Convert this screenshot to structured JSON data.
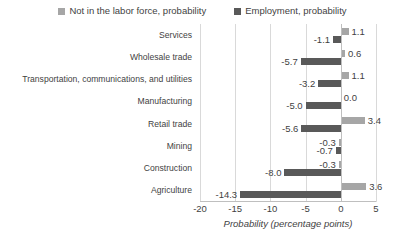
{
  "chart_data": {
    "type": "bar",
    "orientation": "horizontal",
    "title": "",
    "xlabel": "Probability (percentage points)",
    "ylabel": "",
    "xlim": [
      -20,
      5
    ],
    "xticks": [
      -20,
      -15,
      -10,
      -5,
      0,
      5
    ],
    "xtick_labels": [
      "-20",
      "-15",
      "-10",
      "-5",
      "0",
      "5"
    ],
    "grid": true,
    "grid_axis": "x",
    "legend_position": "top",
    "categories": [
      "Services",
      "Wholesale trade",
      "Transportation, communications, and utilities",
      "Manufacturing",
      "Retail trade",
      "Mining",
      "Construction",
      "Agriculture"
    ],
    "series": [
      {
        "name": "Not in the labor force, probability",
        "color": "#a6a6a6",
        "values": [
          1.1,
          0.6,
          1.1,
          0.0,
          3.4,
          -0.3,
          -0.3,
          3.6
        ],
        "labels": [
          "1.1",
          "0.6",
          "1.1",
          "0.0",
          "3.4",
          "-0.3",
          "-0.3",
          "3.6"
        ]
      },
      {
        "name": "Employment, probability",
        "color": "#595959",
        "values": [
          -1.1,
          -5.7,
          -3.2,
          -5.0,
          -5.6,
          -0.7,
          -8.0,
          -14.3
        ],
        "labels": [
          "-1.1",
          "-5.7",
          "-3.2",
          "-5.0",
          "-5.6",
          "-0.7",
          "-8.0",
          "-14.3"
        ]
      }
    ]
  },
  "legend": {
    "items": [
      {
        "label": "Not in the labor force, probability",
        "color": "#a6a6a6"
      },
      {
        "label": "Employment, probability",
        "color": "#595959"
      }
    ]
  },
  "axis": {
    "x_title": "Probability (percentage points)"
  }
}
